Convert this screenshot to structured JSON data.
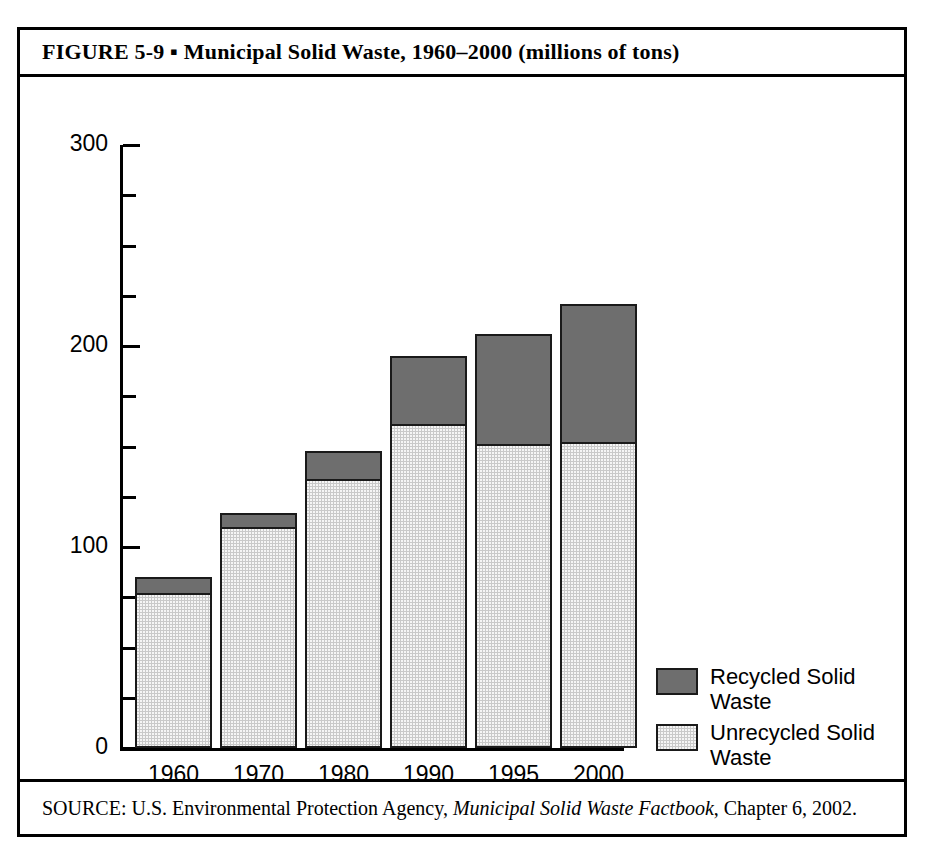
{
  "figure": {
    "title": "FIGURE  5-9  ▪  Municipal Solid Waste, 1960–2000 (millions of tons)",
    "title_label": "FIGURE  5-9",
    "bullet": "▪",
    "source_prefix": "SOURCE: U.S. Environmental Protection Agency, ",
    "source_italic": "Municipal Solid Waste Factbook",
    "source_suffix": ", Chapter 6, 2002.",
    "source_full": "SOURCE: U.S. Environmental Protection Agency, Municipal Solid Waste Factbook, Chapter 6, 2002."
  },
  "colors": {
    "recycled": "#6e6e6e",
    "unrecycled": "#c9c9c9",
    "outline": "#1a1a1a",
    "background": "#ffffff",
    "axis": "#000000"
  },
  "chart_data": {
    "type": "bar",
    "subtype": "stacked",
    "title": "Municipal Solid Waste, 1960–2000 (millions of tons)",
    "xlabel": "",
    "ylabel": "",
    "ylim": [
      0,
      300
    ],
    "ytick_labels": [
      "300",
      "200",
      "100",
      "0"
    ],
    "ytick_values": [
      300,
      200,
      100,
      0
    ],
    "minor_tick_interval": 25,
    "grid": false,
    "legend_position": "bottom-right",
    "categories": [
      "1960",
      "1970",
      "1980",
      "1990",
      "1995",
      "2000"
    ],
    "series": [
      {
        "name": "Recycled Solid Waste",
        "color": "#6e6e6e",
        "values": [
          9,
          8,
          15,
          35,
          56,
          70
        ]
      },
      {
        "name": "Unrecycled Solid Waste",
        "color": "#c9c9c9",
        "values": [
          76,
          109,
          133,
          160,
          150,
          151
        ]
      }
    ],
    "totals": [
      85,
      117,
      148,
      195,
      206,
      221
    ],
    "units": "millions of tons"
  },
  "legend": {
    "entries": [
      {
        "label": "Recycled Solid Waste",
        "swatch": "recycled"
      },
      {
        "label": "Unrecycled Solid Waste",
        "swatch": "unrecycled"
      }
    ]
  }
}
